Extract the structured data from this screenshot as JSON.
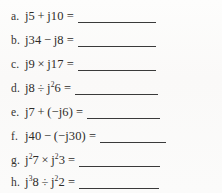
{
  "worksheet": {
    "title": "Complex number j-operator practice problems",
    "background_color": "#fcfbfa",
    "text_color": "#2e2c29",
    "rule_color": "#3a3a3a",
    "problems": [
      {
        "label": "a.",
        "expression": "j5 + j10 =",
        "operand_left": "j5",
        "operator": "+",
        "operand_right": "j10",
        "answer": "",
        "blank_width": 78
      },
      {
        "label": "b.",
        "expression": "j34 − j8 =",
        "operand_left": "j34",
        "operator": "−",
        "operand_right": "j8",
        "answer": "",
        "blank_width": 78
      },
      {
        "label": "c.",
        "expression": "j9 × j17 =",
        "operand_left": "j9",
        "operator": "×",
        "operand_right": "j17",
        "answer": "",
        "blank_width": 78
      },
      {
        "label": "d.",
        "expression": "j8 ÷ j²6 =",
        "operand_left": "j8",
        "operator": "÷",
        "operand_right": "j²6",
        "answer": "",
        "blank_width": 83
      },
      {
        "label": "e.",
        "expression": "j7 + (−j6) =",
        "operand_left": "j7",
        "operator": "+",
        "operand_right": "(−j6)",
        "answer": "",
        "blank_width": 73
      },
      {
        "label": "f.",
        "expression": "j40 − (−j30) =",
        "operand_left": "j40",
        "operator": "−",
        "operand_right": "(−j30)",
        "answer": "",
        "blank_width": 66
      },
      {
        "label": "g.",
        "expression": "j²7 × j²3 =",
        "operand_left": "j²7",
        "operator": "×",
        "operand_right": "j²3",
        "answer": "",
        "blank_width": 81
      },
      {
        "label": "h.",
        "expression": "j³8 ÷ j²2 =",
        "operand_left": "j³8",
        "operator": "÷",
        "operand_right": "j²2",
        "answer": "",
        "blank_width": 80
      }
    ]
  }
}
